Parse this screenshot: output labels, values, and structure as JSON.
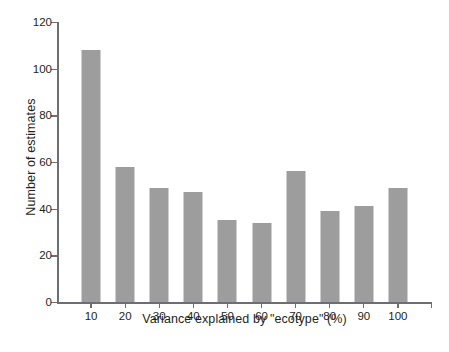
{
  "chart_data": {
    "type": "bar",
    "title": "",
    "xlabel": "Variance explained by \"ecotype\" (%)",
    "ylabel": "Number of estimates",
    "categories": [
      "10",
      "20",
      "30",
      "40",
      "50",
      "60",
      "70",
      "80",
      "90",
      "100"
    ],
    "values": [
      108,
      58,
      49,
      47,
      35,
      34,
      56,
      39,
      41,
      49
    ],
    "ylim": [
      0,
      120
    ],
    "yticks": [
      0,
      20,
      40,
      60,
      80,
      100,
      120
    ],
    "ytick_labels": [
      "0",
      "20",
      "40",
      "60",
      "80",
      "100",
      "120"
    ],
    "grid": false,
    "legend": null,
    "bar_color": "#9d9d9d",
    "axis_color": "#6d6e71",
    "text_color": "#231f20",
    "background": "#ffffff"
  }
}
